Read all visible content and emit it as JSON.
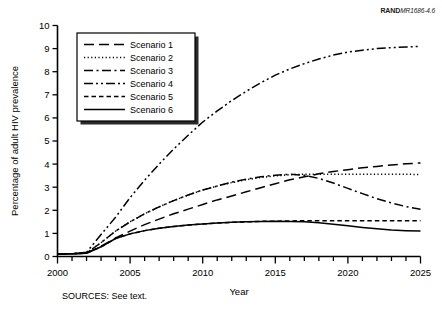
{
  "figure": {
    "rand_tag_bold": "RAND",
    "rand_tag_italic": "MR1686-4.6",
    "source_note": "SOURCES:  See text."
  },
  "chart_data": {
    "type": "line",
    "title": "",
    "xlabel": "Year",
    "ylabel": "Percentage of adult HIV prevalence",
    "xlim": [
      2000,
      2025
    ],
    "ylim": [
      0,
      10
    ],
    "xticks": [
      2000,
      2001,
      2002,
      2003,
      2004,
      2005,
      2006,
      2007,
      2008,
      2009,
      2010,
      2011,
      2012,
      2013,
      2014,
      2015,
      2016,
      2017,
      2018,
      2019,
      2020,
      2021,
      2022,
      2023,
      2024,
      2025
    ],
    "xtick_labels": [
      "2000",
      "",
      "",
      "",
      "",
      "2005",
      "",
      "",
      "",
      "",
      "2010",
      "",
      "",
      "",
      "",
      "2015",
      "",
      "",
      "",
      "",
      "2020",
      "",
      "",
      "",
      "",
      "2025"
    ],
    "yticks": [
      0,
      1,
      2,
      3,
      4,
      5,
      6,
      7,
      8,
      9,
      10
    ],
    "ytick_labels": [
      "0",
      "1",
      "2",
      "3",
      "4",
      "5",
      "6",
      "7",
      "8",
      "9",
      "10"
    ],
    "grid": false,
    "legend_position": "upper-left",
    "x": [
      2000,
      2001,
      2002,
      2003,
      2004,
      2005,
      2006,
      2007,
      2008,
      2009,
      2010,
      2011,
      2012,
      2013,
      2014,
      2015,
      2016,
      2017,
      2018,
      2019,
      2020,
      2021,
      2022,
      2023,
      2024,
      2025
    ],
    "series": [
      {
        "name": "Scenario 1",
        "dash": "long-dash",
        "values": [
          0.1,
          0.12,
          0.15,
          0.45,
          0.8,
          1.1,
          1.38,
          1.62,
          1.85,
          2.05,
          2.25,
          2.45,
          2.62,
          2.8,
          2.98,
          3.15,
          3.32,
          3.45,
          3.58,
          3.68,
          3.76,
          3.84,
          3.9,
          3.96,
          4.01,
          4.05
        ]
      },
      {
        "name": "Scenario 2",
        "dash": "dotted",
        "values": [
          0.1,
          0.12,
          0.15,
          0.6,
          1.1,
          1.5,
          1.85,
          2.15,
          2.42,
          2.66,
          2.88,
          3.05,
          3.2,
          3.32,
          3.42,
          3.49,
          3.54,
          3.56,
          3.56,
          3.56,
          3.56,
          3.56,
          3.56,
          3.56,
          3.56,
          3.55
        ]
      },
      {
        "name": "Scenario 3",
        "dash": "dash-dot",
        "values": [
          0.1,
          0.12,
          0.15,
          0.6,
          1.1,
          1.5,
          1.85,
          2.15,
          2.42,
          2.66,
          2.88,
          3.05,
          3.22,
          3.35,
          3.45,
          3.52,
          3.56,
          3.52,
          3.38,
          3.18,
          2.95,
          2.72,
          2.5,
          2.32,
          2.16,
          2.05
        ]
      },
      {
        "name": "Scenario 4",
        "dash": "dash-dot-dot",
        "values": [
          0.1,
          0.12,
          0.18,
          0.95,
          1.7,
          2.55,
          3.3,
          4.0,
          4.65,
          5.25,
          5.82,
          6.3,
          6.75,
          7.15,
          7.52,
          7.85,
          8.12,
          8.35,
          8.55,
          8.72,
          8.85,
          8.93,
          9.0,
          9.04,
          9.07,
          9.1
        ]
      },
      {
        "name": "Scenario 5",
        "dash": "short-dash",
        "values": [
          0.1,
          0.12,
          0.14,
          0.42,
          0.78,
          0.98,
          1.12,
          1.22,
          1.3,
          1.36,
          1.41,
          1.45,
          1.48,
          1.5,
          1.52,
          1.53,
          1.54,
          1.55,
          1.55,
          1.55,
          1.55,
          1.55,
          1.55,
          1.55,
          1.55,
          1.55
        ]
      },
      {
        "name": "Scenario 6",
        "dash": "solid",
        "values": [
          0.1,
          0.12,
          0.14,
          0.42,
          0.78,
          0.98,
          1.12,
          1.22,
          1.3,
          1.36,
          1.41,
          1.45,
          1.48,
          1.5,
          1.52,
          1.53,
          1.52,
          1.5,
          1.46,
          1.4,
          1.33,
          1.26,
          1.2,
          1.15,
          1.12,
          1.1
        ]
      }
    ],
    "legend_entries": [
      "Scenario 1",
      "Scenario 2",
      "Scenario 3",
      "Scenario 4",
      "Scenario 5",
      "Scenario 6"
    ]
  }
}
